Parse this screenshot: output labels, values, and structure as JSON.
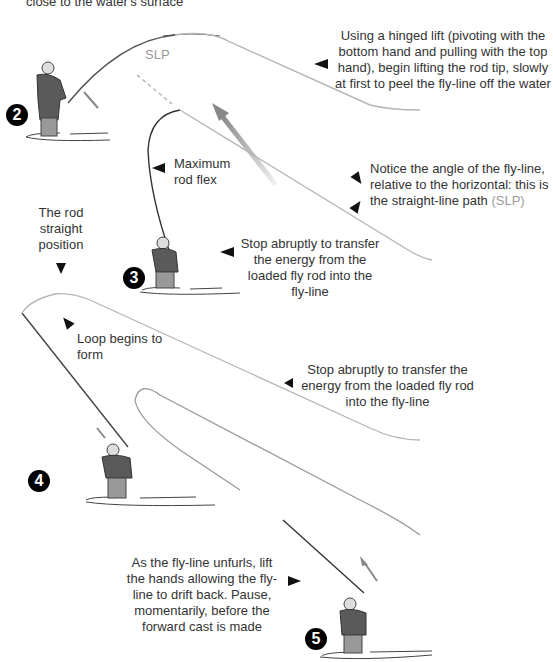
{
  "diagram": {
    "top_caption_fragment": "close to the water's surface",
    "steps": [
      {
        "number": "2",
        "glyph": "❷",
        "caption": "Using a hinged lift (pivoting with the bottom hand and pulling with the top hand), begin lifting the rod tip, slowly at first to peel the fly-line off the water"
      },
      {
        "number": "3",
        "glyph": "❸",
        "caption": "Keep lifting, using the top hand, and when most of the line is off the water stop the rod"
      },
      {
        "number": "4",
        "glyph": "❹",
        "caption": "Stop abruptly to transfer the energy from the loaded fly rod into the fly-line"
      },
      {
        "number": "5",
        "glyph": "❺",
        "caption": "As the fly-line unfurls, lift the hands allowing the fly-line to drift back. Pause, momentarily, before the forward cast is made"
      }
    ],
    "annotations": {
      "slp_label": "SLP",
      "notice_main": "Notice the angle of the fly-line, relative to the horizontal: this is the straight-line path ",
      "notice_slp": "(SLP)",
      "max_flex": "Maximum rod flex",
      "rod_straight": "The rod straight position",
      "loop_forms": "Loop begins to form"
    },
    "colors": {
      "text": "#333333",
      "slp_text": "#9a9a9a",
      "fly_line": "#b5b5b5",
      "rod": "#333333",
      "badge_bg": "#000000",
      "badge_fg": "#ffffff"
    }
  }
}
